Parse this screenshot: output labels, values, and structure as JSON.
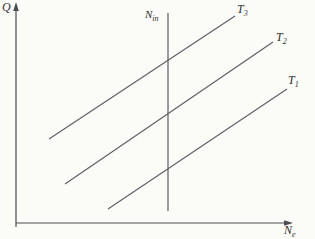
{
  "chart_data": {
    "type": "line",
    "title": "",
    "ylabel": {
      "main": "Q",
      "sub": ""
    },
    "xlabel": {
      "main": "N",
      "sub": "e"
    },
    "grid": false,
    "legend": "none",
    "axis_ranges": "unlabeled (qualitative)",
    "coords": "pixel space 315x239, y down",
    "colors": {
      "background": "#fbfbf8",
      "axis": "#4d4d4f",
      "line": "#5d5d60",
      "text": "#2f2f31"
    },
    "axes": {
      "y_axis": {
        "x": 16,
        "y_bottom": 227,
        "y_top": 10,
        "arrow": "up"
      },
      "x_axis": {
        "y": 223,
        "x_left": 16,
        "x_right": 285,
        "arrow": "right"
      }
    },
    "reference_line": {
      "label": {
        "main": "N",
        "sub": "in"
      },
      "x": 168,
      "y1": 13,
      "y2": 211
    },
    "series": [
      {
        "name": {
          "main": "T",
          "sub": "3"
        },
        "points": [
          [
            49,
            139
          ],
          [
            235,
            16
          ]
        ]
      },
      {
        "name": {
          "main": "T",
          "sub": "2"
        },
        "points": [
          [
            65,
            184
          ],
          [
            273,
            42
          ]
        ]
      },
      {
        "name": {
          "main": "T",
          "sub": "1"
        },
        "points": [
          [
            108,
            209
          ],
          [
            287,
            89
          ]
        ]
      }
    ]
  }
}
